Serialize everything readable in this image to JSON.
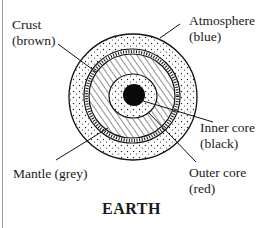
{
  "diagram": {
    "title": "EARTH",
    "layers": [
      {
        "name": "Atmosphere",
        "color_note": "(blue)",
        "pattern": "dots"
      },
      {
        "name": "Crust",
        "color_note": "(brown)",
        "pattern": "vertical-hatch"
      },
      {
        "name": "Mantle",
        "color_note": "(grey)",
        "pattern": "diagonal-hatch"
      },
      {
        "name": "Outer core",
        "color_note": "(red)",
        "pattern": "dots"
      },
      {
        "name": "Inner core",
        "color_note": "(black)",
        "pattern": "solid-black"
      }
    ],
    "labels": {
      "crust_line1": "Crust",
      "crust_line2": "(brown)",
      "atmosphere_line1": "Atmosphere",
      "atmosphere_line2": "(blue)",
      "inner_core_line1": "Inner core",
      "inner_core_line2": "(black)",
      "mantle": "Mantle (grey)",
      "outer_core_line1": "Outer core",
      "outer_core_line2": "(red)"
    }
  }
}
